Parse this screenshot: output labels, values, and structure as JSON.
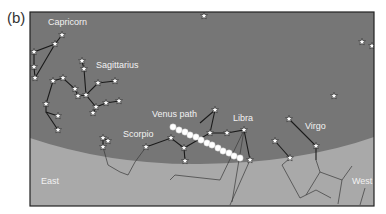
{
  "figure": {
    "panel_label": "(b)",
    "frame": {
      "x": 30,
      "y": 12,
      "w": 344,
      "h": 194
    },
    "colors": {
      "sky": "#767676",
      "ground": "#a9a9a9",
      "frame": "#222222",
      "line": "#1a1a1a",
      "ground_line": "#3a3a3a",
      "star_fill": "#ffffff",
      "venus_dot": "#ffffff",
      "label": "#f2f2f2"
    },
    "labels": [
      {
        "name": "capricorn-label",
        "text": "Capricorn",
        "x": 48,
        "y": 25
      },
      {
        "name": "sagittarius-label",
        "text": "Sagittarius",
        "x": 96,
        "y": 68
      },
      {
        "name": "venus-path-label",
        "text": "Venus path",
        "x": 152,
        "y": 117
      },
      {
        "name": "libra-label",
        "text": "Libra",
        "x": 233,
        "y": 121
      },
      {
        "name": "scorpio-label",
        "text": "Scorpio",
        "x": 123,
        "y": 137
      },
      {
        "name": "virgo-label",
        "text": "Virgo",
        "x": 305,
        "y": 129
      },
      {
        "name": "east-label",
        "text": "East",
        "x": 41,
        "y": 184
      },
      {
        "name": "west-label",
        "text": "West",
        "x": 352,
        "y": 184
      }
    ],
    "stars": [
      [
        62,
        35
      ],
      [
        55,
        44
      ],
      [
        34,
        52
      ],
      [
        34,
        67
      ],
      [
        35,
        78
      ],
      [
        82,
        61
      ],
      [
        84,
        69
      ],
      [
        53,
        81
      ],
      [
        63,
        78
      ],
      [
        75,
        89
      ],
      [
        78,
        96
      ],
      [
        86,
        95
      ],
      [
        115,
        81
      ],
      [
        98,
        83
      ],
      [
        96,
        107
      ],
      [
        106,
        103
      ],
      [
        119,
        101
      ],
      [
        93,
        113
      ],
      [
        46,
        104
      ],
      [
        58,
        116
      ],
      [
        58,
        130
      ],
      [
        103,
        138
      ],
      [
        108,
        141
      ],
      [
        103,
        147
      ],
      [
        146,
        147
      ],
      [
        171,
        138
      ],
      [
        184,
        148
      ],
      [
        185,
        161
      ],
      [
        215,
        110
      ],
      [
        210,
        133
      ],
      [
        227,
        133
      ],
      [
        244,
        130
      ],
      [
        250,
        160
      ],
      [
        289,
        119
      ],
      [
        316,
        146
      ],
      [
        275,
        141
      ],
      [
        290,
        158
      ],
      [
        204,
        16
      ],
      [
        362,
        42
      ],
      [
        372,
        46
      ],
      [
        334,
        96
      ]
    ],
    "constellation_lines": [
      [
        [
          62,
          35
        ],
        [
          55,
          44
        ],
        [
          34,
          52
        ],
        [
          34,
          67
        ],
        [
          35,
          78
        ],
        [
          55,
          44
        ]
      ],
      [
        [
          82,
          61
        ],
        [
          84,
          69
        ],
        [
          86,
          95
        ]
      ],
      [
        [
          53,
          81
        ],
        [
          63,
          78
        ],
        [
          75,
          89
        ],
        [
          78,
          96
        ],
        [
          86,
          95
        ],
        [
          98,
          83
        ],
        [
          115,
          81
        ]
      ],
      [
        [
          86,
          95
        ],
        [
          96,
          107
        ],
        [
          106,
          103
        ],
        [
          119,
          101
        ]
      ],
      [
        [
          96,
          107
        ],
        [
          93,
          113
        ]
      ],
      [
        [
          53,
          81
        ],
        [
          46,
          104
        ],
        [
          46,
          112
        ],
        [
          58,
          116
        ]
      ],
      [
        [
          46,
          112
        ],
        [
          58,
          130
        ]
      ],
      [
        [
          103,
          138
        ],
        [
          108,
          141
        ]
      ],
      [
        [
          103,
          138
        ],
        [
          103,
          147
        ]
      ],
      [
        [
          146,
          147
        ],
        [
          171,
          138
        ],
        [
          184,
          148
        ],
        [
          210,
          133
        ],
        [
          215,
          110
        ],
        [
          200,
          123
        ]
      ],
      [
        [
          210,
          133
        ],
        [
          227,
          133
        ],
        [
          244,
          130
        ],
        [
          250,
          160
        ]
      ],
      [
        [
          184,
          148
        ],
        [
          185,
          161
        ]
      ],
      [
        [
          289,
          119
        ],
        [
          316,
          146
        ],
        [
          316,
          160
        ]
      ],
      [
        [
          275,
          141
        ],
        [
          290,
          158
        ]
      ]
    ],
    "ground_lines": [
      [
        [
          103,
          147
        ],
        [
          108,
          165
        ],
        [
          120,
          172
        ],
        [
          128,
          175
        ],
        [
          135,
          162
        ],
        [
          146,
          147
        ]
      ],
      [
        [
          244,
          130
        ],
        [
          220,
          180
        ],
        [
          175,
          175
        ],
        [
          170,
          180
        ]
      ],
      [
        [
          244,
          130
        ],
        [
          232,
          202
        ]
      ],
      [
        [
          250,
          160
        ],
        [
          230,
          205
        ]
      ],
      [
        [
          290,
          158
        ],
        [
          282,
          165
        ],
        [
          300,
          198
        ]
      ],
      [
        [
          300,
          198
        ],
        [
          316,
          190
        ],
        [
          331,
          198
        ]
      ],
      [
        [
          316,
          160
        ],
        [
          320,
          172
        ],
        [
          342,
          180
        ],
        [
          352,
          166
        ]
      ],
      [
        [
          320,
          172
        ],
        [
          306,
          195
        ]
      ],
      [
        [
          342,
          180
        ],
        [
          338,
          204
        ]
      ],
      [
        [
          365,
          188
        ],
        [
          360,
          205
        ]
      ]
    ],
    "venus_path": [
      [
        173,
        127
      ],
      [
        179,
        130
      ],
      [
        185,
        132
      ],
      [
        190,
        135
      ],
      [
        196,
        137
      ],
      [
        201,
        140
      ],
      [
        207,
        143
      ],
      [
        212,
        145
      ],
      [
        218,
        148
      ],
      [
        223,
        151
      ],
      [
        229,
        153
      ],
      [
        234,
        156
      ],
      [
        240,
        158
      ]
    ]
  }
}
